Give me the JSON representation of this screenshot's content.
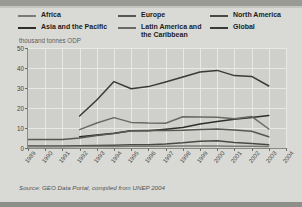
{
  "legend": {
    "columns": [
      [
        {
          "label": "Africa",
          "color": "#7b7b76",
          "name": "africa"
        },
        {
          "label": "Asia and the Pacific",
          "color": "#2e2e2c",
          "name": "asia-and-the-pacific"
        }
      ],
      [
        {
          "label": "Europe",
          "color": "#575752",
          "name": "europe"
        },
        {
          "label": "Latin America and the Caribbean",
          "color": "#6a6a65",
          "name": "latin-america-and-the-caribbean"
        }
      ],
      [
        {
          "label": "North America",
          "color": "#4a4a45",
          "name": "north-america"
        },
        {
          "label": "Global",
          "color": "#3a3a36",
          "name": "global"
        }
      ]
    ]
  },
  "axis_title": "thousand tonnes ODP",
  "source": "Source: GEO Data Portal, compiled from UNEP 2004",
  "chart_data": {
    "type": "line",
    "title": "",
    "subtitle": "thousand tonnes ODP",
    "xlabel": "",
    "ylabel": "thousand tonnes ODP",
    "ylim": [
      0,
      50
    ],
    "yticks": [
      0,
      10,
      20,
      30,
      40,
      50
    ],
    "grid": true,
    "legend_position": "top",
    "x": [
      1989,
      1990,
      1991,
      1992,
      1993,
      1994,
      1995,
      1996,
      1997,
      1998,
      1999,
      2000,
      2001,
      2002,
      2003,
      2004
    ],
    "categories": [
      "1989",
      "1990",
      "1991",
      "1992",
      "1993",
      "1994",
      "1995",
      "1996",
      "1997",
      "1998",
      "1999",
      "2000",
      "2001",
      "2002",
      "2003",
      "2004"
    ],
    "series": [
      {
        "name": "Global",
        "color": "#3a3a36",
        "values": [
          null,
          null,
          null,
          16.0,
          24.0,
          33.2,
          29.6,
          30.7,
          33.0,
          35.5,
          38.0,
          38.8,
          36.2,
          35.8,
          31.0,
          null
        ]
      },
      {
        "name": "Asia and the Pacific",
        "color": "#2e2e2c",
        "values": [
          null,
          null,
          null,
          5.6,
          6.5,
          7.4,
          8.6,
          8.6,
          9.4,
          10.3,
          12.0,
          13.3,
          14.4,
          15.2,
          16.3,
          null
        ]
      },
      {
        "name": "Latin America and the Caribbean",
        "color": "#6a6a65",
        "values": [
          null,
          null,
          null,
          9.2,
          12.5,
          15.2,
          12.8,
          12.5,
          12.4,
          15.6,
          15.5,
          15.4,
          14.6,
          15.8,
          9.5,
          null
        ]
      },
      {
        "name": "Europe",
        "color": "#575752",
        "values": [
          4.3,
          4.3,
          4.2,
          5.0,
          6.3,
          7.3,
          8.6,
          8.7,
          8.7,
          8.9,
          9.3,
          9.5,
          9.0,
          8.4,
          5.6,
          null
        ]
      },
      {
        "name": "North America",
        "color": "#4a4a45",
        "values": [
          1.0,
          1.0,
          1.0,
          1.1,
          1.2,
          1.4,
          1.6,
          1.6,
          2.0,
          2.6,
          3.4,
          3.6,
          2.8,
          2.2,
          1.6,
          null
        ]
      },
      {
        "name": "Africa",
        "color": "#7b7b76",
        "values": [
          0.6,
          0.6,
          0.6,
          0.7,
          0.7,
          0.8,
          0.9,
          0.9,
          0.9,
          1.0,
          1.0,
          1.0,
          0.9,
          0.9,
          0.8,
          null
        ]
      }
    ]
  }
}
